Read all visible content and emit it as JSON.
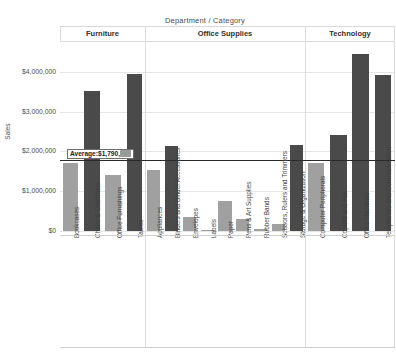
{
  "header": {
    "column_field_title": "Department  /  Category",
    "panels": [
      {
        "label": "Furniture"
      },
      {
        "label": "Office Supplies"
      },
      {
        "label": "Technology"
      }
    ]
  },
  "axis": {
    "y_title": "Sales",
    "y_ticks": [
      "$4,000,000",
      "$3,000,000",
      "$2,000,000",
      "$1,000,000",
      "$0"
    ],
    "y_tick_values": [
      4000000,
      3000000,
      2000000,
      1000000,
      0
    ],
    "ylim": [
      0,
      4600000
    ]
  },
  "reference_line": {
    "label_prefix": "Average: ",
    "label_value": "$1,790,",
    "label_value_masked": "282",
    "value": 1790282
  },
  "colors": {
    "bar_above_average": "#4a4a4a",
    "bar_below_average": "#a0a0a0",
    "reference_line": "#2b2b2b",
    "gridline": "#e6e6e6",
    "text": "#3f3f3f"
  },
  "chart_data": {
    "type": "bar",
    "title": "Department  /  Category",
    "xlabel": "",
    "ylabel": "Sales",
    "ylim": [
      0,
      4600000
    ],
    "grid": true,
    "legend": "none",
    "groups": [
      {
        "name": "Furniture",
        "categories": [
          "Bookcases",
          "Chairs & Chairmats",
          "Office Furnishings",
          "Tables"
        ],
        "values": [
          1720000,
          3520000,
          1400000,
          3940000
        ]
      },
      {
        "name": "Office Supplies",
        "categories": [
          "Appliances",
          "Binders and Binder Accessories",
          "Envelopes",
          "Labels",
          "Paper",
          "Pens & Art Supplies",
          "Rubber Bands",
          "Scissors, Rulers and Trimmers",
          "Storage & Organization"
        ],
        "values": [
          1530000,
          2130000,
          360000,
          30000,
          750000,
          290000,
          50000,
          170000,
          2160000
        ]
      },
      {
        "name": "Technology",
        "categories": [
          "Computer Peripherals",
          "Copiers and Fax",
          "Office Machines",
          "Telephones and Communication"
        ],
        "values": [
          1710000,
          2420000,
          4450000,
          3930000
        ]
      }
    ],
    "average": 1790282,
    "average_label": "Average: $1,790,282"
  }
}
